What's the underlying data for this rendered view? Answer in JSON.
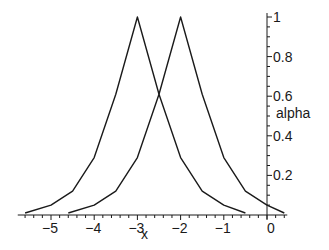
{
  "chart_data": {
    "type": "line",
    "title": "",
    "xlabel": "x",
    "ylabel": "alpha",
    "xlim": [
      -5.7,
      0.4
    ],
    "ylim": [
      0,
      1
    ],
    "grid": false,
    "legend": null,
    "x_ticks": [
      -5,
      -4,
      -3,
      -2,
      -1,
      0
    ],
    "x_tick_labels": [
      "−5",
      "−4",
      "−3",
      "−2",
      "−1",
      "0"
    ],
    "y_ticks": [
      0.2,
      0.4,
      0.6,
      0.8,
      1
    ],
    "y_tick_labels": [
      "0.2",
      "0.4",
      "0.6",
      "0.8",
      "1"
    ],
    "series": [
      {
        "name": "peak at x=-3",
        "color": "#1a1a1a",
        "x": [
          -5.6,
          -5.0,
          -4.5,
          -4.0,
          -3.5,
          -3.0,
          -2.5,
          -2.0,
          -1.5,
          -1.0,
          -0.5
        ],
        "values": [
          0.01,
          0.05,
          0.12,
          0.29,
          0.61,
          1.0,
          0.61,
          0.29,
          0.12,
          0.05,
          0.01
        ]
      },
      {
        "name": "peak at x=-2",
        "color": "#1a1a1a",
        "x": [
          -4.6,
          -4.0,
          -3.5,
          -3.0,
          -2.5,
          -2.0,
          -1.5,
          -1.0,
          -0.5,
          0.0,
          0.4
        ],
        "values": [
          0.01,
          0.05,
          0.12,
          0.29,
          0.61,
          1.0,
          0.61,
          0.29,
          0.12,
          0.05,
          0.01
        ]
      }
    ]
  },
  "axes": {
    "xlabel": "x",
    "ylabel": "alpha"
  }
}
